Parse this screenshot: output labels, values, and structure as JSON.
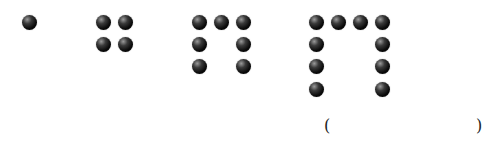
{
  "figure": {
    "ball_color": "#000000",
    "groups": [
      {
        "index": 1,
        "count": 1,
        "balls": [
          [
            29,
            22
          ]
        ]
      },
      {
        "index": 2,
        "count": 4,
        "balls": [
          [
            103,
            22
          ],
          [
            125,
            22
          ],
          [
            103,
            44
          ],
          [
            125,
            44
          ]
        ]
      },
      {
        "index": 3,
        "count": 7,
        "balls": [
          [
            199,
            22
          ],
          [
            221,
            22
          ],
          [
            243,
            22
          ],
          [
            199,
            44
          ],
          [
            243,
            44
          ],
          [
            199,
            66
          ],
          [
            243,
            66
          ]
        ]
      },
      {
        "index": 4,
        "count": 10,
        "balls": [
          [
            316,
            22
          ],
          [
            338,
            22
          ],
          [
            360,
            22
          ],
          [
            382,
            22
          ],
          [
            316,
            44
          ],
          [
            382,
            44
          ],
          [
            316,
            66
          ],
          [
            382,
            66
          ],
          [
            316,
            89
          ],
          [
            382,
            89
          ]
        ]
      }
    ],
    "answer_blank": {
      "open": "(",
      "close": ")",
      "value": ""
    }
  }
}
